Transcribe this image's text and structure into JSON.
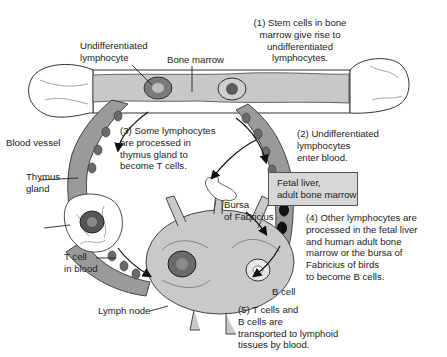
{
  "diagram": {
    "type": "lymphocyte-origin-process-figure",
    "structures": {
      "bone_marrow": "Bone marrow",
      "undifferentiated_lymphocyte": "Undifferentiated\nlymphocyte",
      "blood_vessel": "Blood vessel",
      "thymus_gland": "Thymus\ngland",
      "bursa": "Bursa\nof Fabricius",
      "t_cell": "T cell\nin blood",
      "b_cell": "B cell",
      "lymph_node": "Lymph node",
      "fetal_liver_box": "Fetal liver,\nadult bone marrow"
    },
    "steps": [
      {
        "id": 1,
        "text": "(1) Stem cells in bone\nmarrow give rise to\nundifferentiated\nlymphocytes."
      },
      {
        "id": 2,
        "text": "(2) Undifferentiated\nlymphocytes\n      enter blood."
      },
      {
        "id": 3,
        "text": "(3)  Some lymphocytes\n  are processed in\nthymus gland to\nbecome T cells."
      },
      {
        "id": 4,
        "text": "(4) Other lymphocytes are\nprocessed in the fetal liver\nand human adult bone\nmarrow or the bursa of\nFabricius of birds\nto become B cells."
      },
      {
        "id": 5,
        "text": "(5) T cells and\n B cells are\ntransported to lymphoid\ntissues by blood."
      }
    ],
    "colors": {
      "vessel_fill": "#9a9a9a",
      "marrow_fill": "#c8c8c8",
      "bone_fill": "#ffffff",
      "outline": "#333333",
      "box_fill": "#d7d7d7",
      "b_cell_fill": "#111111"
    }
  }
}
